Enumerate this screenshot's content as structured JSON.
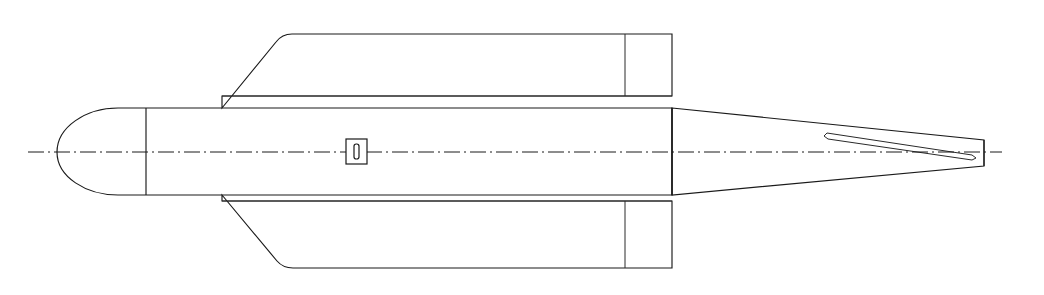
{
  "drawing": {
    "title": "Missile side elevation line drawing",
    "view": "side-elevation",
    "background_color": "#ffffff",
    "line_color": "#1a1a1a",
    "canvas": {
      "width": 1044,
      "height": 295
    },
    "centerline": {
      "name": "axis-centerline",
      "style": "dash-dot",
      "y": 152,
      "x_start": 28,
      "x_end": 1002
    },
    "body": {
      "name": "fuselage",
      "nose_tip_x": 57,
      "nose_joint_x": 146,
      "top_y": 108,
      "bottom_y": 195,
      "aft_station_x": 672
    },
    "upper_fin": {
      "name": "upper-fin",
      "leading_edge_root_x": 222,
      "leading_edge_root_y": 108,
      "tip_top_y": 34,
      "tip_start_x": 288,
      "trailing_edge_x": 672,
      "root_chord_y": 96,
      "hinge_line_x": 625
    },
    "lower_fin": {
      "name": "lower-fin",
      "leading_edge_root_x": 222,
      "leading_edge_root_y": 195,
      "tip_bottom_y": 268,
      "tip_start_x": 288,
      "trailing_edge_x": 672,
      "root_chord_y": 201,
      "hinge_line_x": 625
    },
    "tail_cone": {
      "name": "tail-cone",
      "start_x": 672,
      "end_x": 984,
      "end_top_y": 140,
      "end_bottom_y": 166
    },
    "tail_slot": {
      "name": "tail-slot-detail",
      "start_x": 824,
      "end_x": 978,
      "description": "thin elongated slot in tail cone"
    },
    "center_detail": {
      "name": "access-port-detail",
      "box_x": 346,
      "box_y": 139,
      "box_width": 21,
      "box_height": 25,
      "slot_width": 5,
      "slot_height": 15
    }
  }
}
